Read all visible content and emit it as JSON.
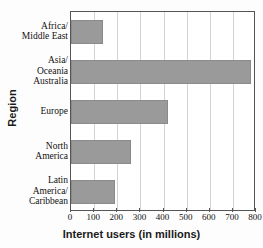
{
  "chart_data": {
    "type": "bar",
    "orientation": "horizontal",
    "title": "",
    "xlabel": "Internet users (in millions)",
    "ylabel": "Region",
    "categories": [
      "Africa/\nMiddle East",
      "Asia/\nOceania\nAustralia",
      "Europe",
      "North\nAmerica",
      "Latin\nAmerica/\nCaribbean"
    ],
    "category_lines": [
      [
        "Africa/",
        "Middle East"
      ],
      [
        "Asia/",
        "Oceania",
        "Australia"
      ],
      [
        "Europe"
      ],
      [
        "North",
        "America"
      ],
      [
        "Latin",
        "America/",
        "Caribbean"
      ]
    ],
    "values": [
      140,
      780,
      420,
      260,
      190
    ],
    "xlim": [
      0,
      800
    ],
    "xticks": [
      0,
      100,
      200,
      300,
      400,
      500,
      600,
      700,
      800
    ],
    "xtick_labels": [
      "0",
      "100",
      "200",
      "300",
      "400",
      "500",
      "600",
      "700",
      "800"
    ],
    "grid": true,
    "grid_axis": "x",
    "legend": false,
    "bar_color": "#9a9a9a",
    "bar_edge_color": "#8a8a8a",
    "frame_color": "#555555",
    "grid_color": "#d2d2d2",
    "background": "#ffffff"
  }
}
